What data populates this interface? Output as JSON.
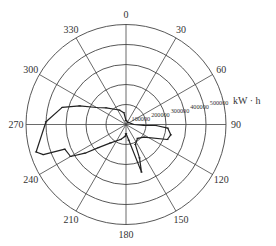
{
  "chart_data": {
    "type": "polar-line",
    "title": "",
    "unit_label": "kW · h",
    "angle_direction": "clockwise",
    "angle_zero": "north",
    "angle_ticks": [
      0,
      30,
      60,
      90,
      120,
      150,
      180,
      210,
      240,
      270,
      300,
      330
    ],
    "angle_tick_labels": [
      "0",
      "30",
      "60",
      "90",
      "120",
      "150",
      "180",
      "210",
      "240",
      "270",
      "300",
      "330"
    ],
    "radial_ticks": [
      100000,
      200000,
      300000,
      400000,
      500000
    ],
    "radial_tick_labels": [
      "100000",
      "200000",
      "300000",
      "400000",
      "500000"
    ],
    "rlim": [
      0,
      500000
    ],
    "grid": true,
    "series": [
      {
        "name": "energy",
        "points": [
          {
            "angle": 0,
            "value": 20000
          },
          {
            "angle": 350,
            "value": 60000
          },
          {
            "angle": 335,
            "value": 80000
          },
          {
            "angle": 310,
            "value": 130000
          },
          {
            "angle": 300,
            "value": 170000
          },
          {
            "angle": 292,
            "value": 250000
          },
          {
            "angle": 285,
            "value": 330000
          },
          {
            "angle": 272,
            "value": 400000
          },
          {
            "angle": 253,
            "value": 470000
          },
          {
            "angle": 250,
            "value": 440000
          },
          {
            "angle": 248,
            "value": 330000
          },
          {
            "angle": 240,
            "value": 320000
          },
          {
            "angle": 235,
            "value": 250000
          },
          {
            "angle": 230,
            "value": 180000
          },
          {
            "angle": 220,
            "value": 120000
          },
          {
            "angle": 200,
            "value": 80000
          },
          {
            "angle": 185,
            "value": 60000
          },
          {
            "angle": 180,
            "value": 45000
          },
          {
            "angle": 170,
            "value": 80000
          },
          {
            "angle": 162,
            "value": 250000
          },
          {
            "angle": 158,
            "value": 180000
          },
          {
            "angle": 155,
            "value": 110000
          },
          {
            "angle": 140,
            "value": 90000
          },
          {
            "angle": 125,
            "value": 110000
          },
          {
            "angle": 110,
            "value": 220000
          },
          {
            "angle": 103,
            "value": 230000
          },
          {
            "angle": 95,
            "value": 210000
          },
          {
            "angle": 92,
            "value": 150000
          },
          {
            "angle": 93,
            "value": 90000
          },
          {
            "angle": 90,
            "value": 40000
          },
          {
            "angle": 45,
            "value": 15000
          },
          {
            "angle": 0,
            "value": 20000
          }
        ]
      }
    ]
  }
}
